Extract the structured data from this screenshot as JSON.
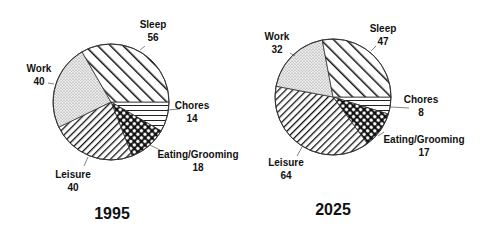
{
  "chart_data": [
    {
      "type": "pie",
      "title": "1995",
      "unit": "hours per week",
      "center": [
        111,
        102
      ],
      "radius": 58,
      "title_pos": [
        112,
        219
      ],
      "slices": [
        {
          "name": "Chores",
          "value": 14,
          "pattern": "horizontal",
          "label_pos": [
            192,
            109
          ],
          "leader": [
            [
              167,
              110
            ],
            [
              180,
              109
            ]
          ]
        },
        {
          "name": "Eating/Grooming",
          "value": 18,
          "pattern": "dots-grid",
          "label_pos": [
            198,
            158
          ],
          "leader": [
            [
              150,
              145
            ],
            [
              160,
              150
            ]
          ]
        },
        {
          "name": "Leisure",
          "value": 40,
          "pattern": "back-diagonal",
          "label_pos": [
            73,
            178
          ],
          "leader": [
            [
              88,
              157
            ],
            [
              84,
              166
            ]
          ]
        },
        {
          "name": "Work",
          "value": 40,
          "pattern": "stipple",
          "label_pos": [
            39,
            72
          ],
          "leader": [
            [
              48,
              83
            ],
            [
              54,
              84
            ]
          ]
        },
        {
          "name": "Sleep",
          "value": 56,
          "pattern": "forward-diagonal",
          "label_pos": [
            153,
            28
          ],
          "leader": [
            [
              140,
              50
            ],
            [
              145,
              46
            ]
          ]
        }
      ]
    },
    {
      "type": "pie",
      "title": "2025",
      "unit": "hours per week",
      "center": [
        333,
        97
      ],
      "radius": 58,
      "title_pos": [
        333,
        215
      ],
      "slices": [
        {
          "name": "Chores",
          "value": 8,
          "pattern": "horizontal",
          "label_pos": [
            421,
            103
          ],
          "leader": [
            [
              391,
              107
            ],
            [
              409,
              108
            ]
          ]
        },
        {
          "name": "Eating/Grooming",
          "value": 17,
          "pattern": "dots-grid",
          "label_pos": [
            424,
            143
          ],
          "leader": [
            [
              378,
              136
            ],
            [
              384,
              132
            ]
          ]
        },
        {
          "name": "Leisure",
          "value": 64,
          "pattern": "back-diagonal",
          "label_pos": [
            286,
            166
          ],
          "leader": [
            [
              302,
              147
            ],
            [
              297,
              156
            ]
          ]
        },
        {
          "name": "Work",
          "value": 32,
          "pattern": "stipple",
          "label_pos": [
            277,
            40
          ],
          "leader": [
            [
              290,
              53
            ],
            [
              295,
              56
            ]
          ]
        },
        {
          "name": "Sleep",
          "value": 47,
          "pattern": "forward-diagonal",
          "label_pos": [
            383,
            32
          ],
          "leader": [
            [
              371,
              51
            ],
            [
              376,
              46
            ]
          ]
        }
      ]
    }
  ],
  "legend": null,
  "total_hours": 168
}
